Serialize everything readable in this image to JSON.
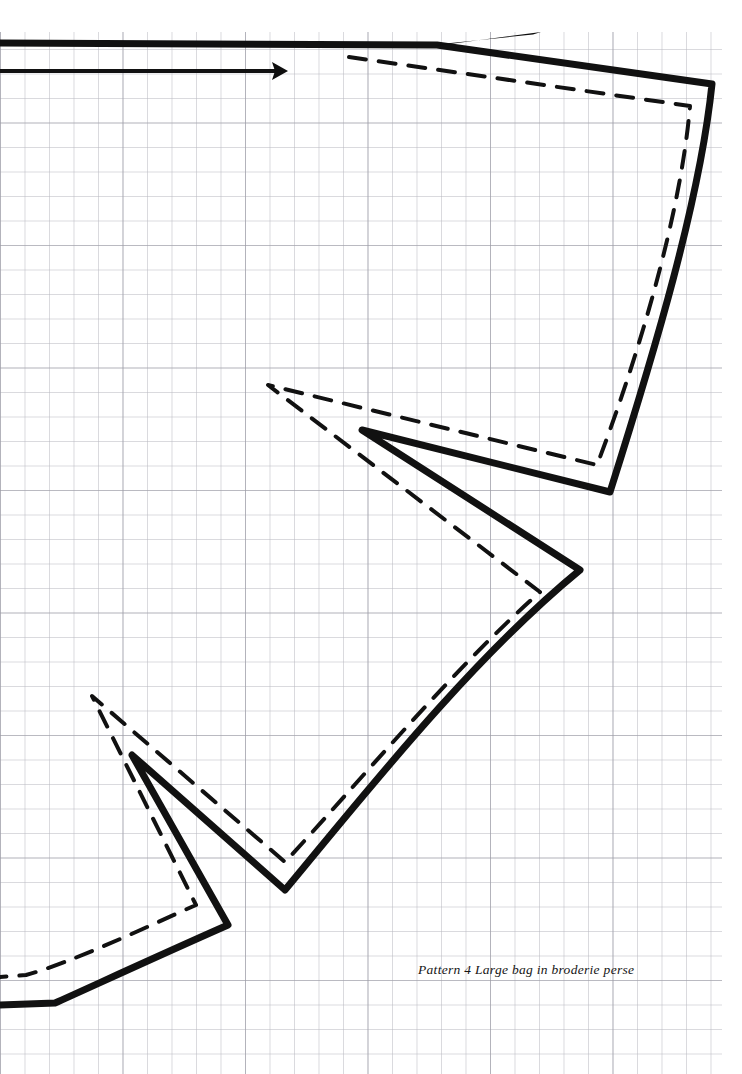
{
  "page": {
    "width": 742,
    "height": 1074,
    "background_color": "#ffffff",
    "title": "Pattern 4 Large bag in broderie perse"
  },
  "caption": {
    "text": "Pattern 4 Large bag in broderie perse"
  },
  "grid": {
    "label": "graph-paper-grid",
    "cell_size_px": 24.5,
    "line_color": "#b4b4bc",
    "major_line_color": "#93939d",
    "major_every": 5,
    "origin_x": 0,
    "origin_y": 0,
    "extent_right_px": 722,
    "extent_bottom_px": 1074,
    "top_margin_px": 32
  },
  "drawing": {
    "label": "sewing-pattern-piece",
    "stroke_color": "#111111",
    "cutting_line": {
      "name": "cutting-line-solid",
      "style": "solid",
      "stroke_width": 7,
      "path": "M 0 43 L 437 45 L 712 84 C 700 200 655 350 610 492 L 362 430 L 580 570 C 470 660 360 800 285 890 L 132 755 L 228 925 C 160 955 95 985 55 1003 L 0 1005"
    },
    "seam_line": {
      "name": "seam-line-dashed",
      "style": "dashed",
      "stroke_width": 4,
      "dash_pattern": "17 13",
      "path": "M 349 57 L 690 106 C 681 212 640 352 597 465 L 268 385 L 540 592 C 452 670 352 790 285 862 L 92 696 L 196 905 C 140 930 70 963 26 975 L 0 977"
    },
    "grain_line": {
      "name": "grain-line-arrow",
      "style": "solid-with-arrowhead",
      "stroke_width": 4,
      "start_x": 0,
      "start_y": 71,
      "end_x": 288,
      "end_y": 71,
      "arrow_direction": "right"
    },
    "top_spike": {
      "name": "pattern-top-spike-wedge",
      "tip_x": 541,
      "tip_y": 32,
      "base_x": 437,
      "base_y": 45
    }
  }
}
